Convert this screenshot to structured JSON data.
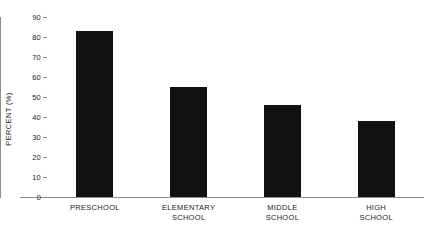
{
  "chart_data": {
    "type": "bar",
    "title": "",
    "xlabel": "",
    "ylabel": "PERCENT (%)",
    "categories": [
      "PRESCHOOL",
      "ELEMENTARY SCHOOL",
      "MIDDLE SCHOOL",
      "HIGH SCHOOL"
    ],
    "values": [
      83,
      55,
      46,
      38
    ],
    "ylim": [
      0,
      90
    ],
    "ytick_labels": [
      "0",
      "10",
      "20",
      "30",
      "40",
      "50",
      "60",
      "70",
      "80",
      "90"
    ],
    "ytick_values": [
      0,
      10,
      20,
      30,
      40,
      50,
      60,
      70,
      80,
      90
    ],
    "grid": false,
    "legend": null,
    "bar_color": "#111111",
    "axis_color": "#8d8d8d",
    "text_color": "#1a1a1a",
    "background_color": "#ffffff"
  },
  "axis": {
    "y_title": "PERCENT (%)"
  },
  "category_labels": [
    {
      "line1": "PRESCHOOL",
      "line2": ""
    },
    {
      "line1": "ELEMENTARY",
      "line2": "SCHOOL"
    },
    {
      "line1": "MIDDLE",
      "line2": "SCHOOL"
    },
    {
      "line1": "HIGH",
      "line2": "SCHOOL"
    }
  ]
}
